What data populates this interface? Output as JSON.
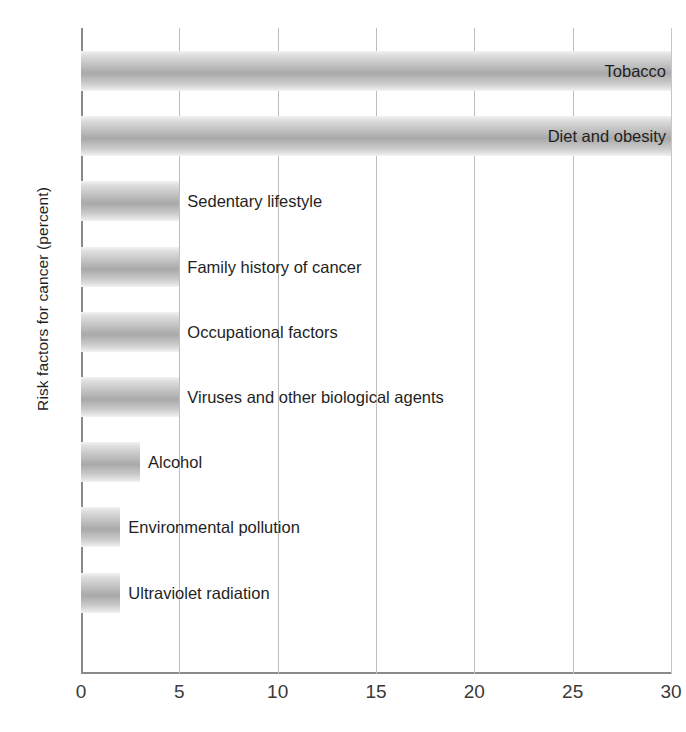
{
  "chart_data": {
    "type": "bar",
    "orientation": "horizontal",
    "title": "",
    "xlabel": "",
    "ylabel": "Risk factors for cancer (percent)",
    "xlim": [
      0,
      30
    ],
    "xticks": [
      0,
      5,
      10,
      15,
      20,
      25,
      30
    ],
    "xtick_labels": [
      "0",
      "5",
      "10",
      "15",
      "20",
      "25",
      "30"
    ],
    "grid": "vertical",
    "legend": "none",
    "categories": [
      "Tobacco",
      "Diet and obesity",
      "Sedentary lifestyle",
      "Family history of cancer",
      "Occupational factors",
      "Viruses and other biological agents",
      "Alcohol",
      "Environmental pollution",
      "Ultraviolet radiation"
    ],
    "values": [
      30,
      30,
      5,
      5,
      5,
      5,
      3,
      2,
      2
    ],
    "bars": [
      {
        "label": "Tobacco",
        "value": 30,
        "label_position": "inside"
      },
      {
        "label": "Diet and obesity",
        "value": 30,
        "label_position": "inside"
      },
      {
        "label": "Sedentary lifestyle",
        "value": 5,
        "label_position": "outside"
      },
      {
        "label": "Family history of cancer",
        "value": 5,
        "label_position": "outside"
      },
      {
        "label": "Occupational factors",
        "value": 5,
        "label_position": "outside"
      },
      {
        "label": "Viruses and other biological agents",
        "value": 5,
        "label_position": "outside"
      },
      {
        "label": "Alcohol",
        "value": 3,
        "label_position": "outside"
      },
      {
        "label": "Environmental pollution",
        "value": 2,
        "label_position": "outside"
      },
      {
        "label": "Ultraviolet radiation",
        "value": 2,
        "label_position": "outside"
      }
    ]
  },
  "colors": {
    "bar_light": "#f2f2f2",
    "bar_mid": "#a9a9a9",
    "axis": "#8a8a8a",
    "gridline": "#bdbdbd",
    "text": "#1f1f1f"
  }
}
